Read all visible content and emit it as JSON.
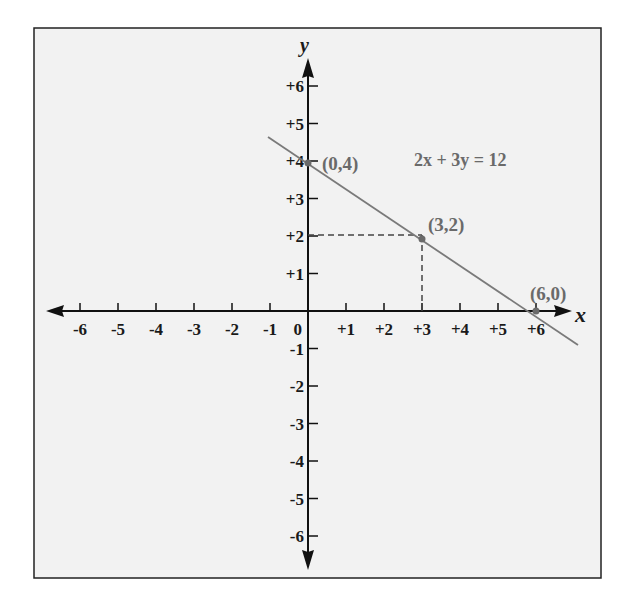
{
  "chart_data": {
    "type": "line",
    "title": "",
    "equation": "2x + 3y = 12",
    "xlabel": "x",
    "ylabel": "y",
    "xlim": [
      -6,
      6
    ],
    "ylim": [
      -6,
      6
    ],
    "x_ticks": [
      "-6",
      "-5",
      "-4",
      "-3",
      "-2",
      "-1",
      "0",
      "+1",
      "+2",
      "+3",
      "+4",
      "+5",
      "+6"
    ],
    "y_ticks": [
      "+6",
      "+5",
      "+4",
      "+3",
      "+2",
      "+1",
      "-1",
      "-2",
      "-3",
      "-4",
      "-5",
      "-6"
    ],
    "grid": false,
    "series": [
      {
        "name": "2x + 3y = 12",
        "x": [
          -1.0,
          7.2
        ],
        "y": [
          4.67,
          -0.8
        ]
      }
    ],
    "points": [
      {
        "label": "(0,4)",
        "x": 0,
        "y": 4
      },
      {
        "label": "(3,2)",
        "x": 3,
        "y": 2
      },
      {
        "label": "(6,0)",
        "x": 6,
        "y": 0
      }
    ],
    "annotations": [
      "dashed guide lines from (3,2) to x=3 and y=2"
    ],
    "colors": {
      "line": "#7a7a7a",
      "axis": "#111111",
      "frame_bg": "#f2f2f2",
      "point": "#6a6a6a"
    }
  }
}
